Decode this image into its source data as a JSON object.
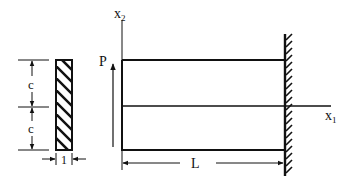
{
  "diagram": {
    "type": "cantilever-beam",
    "labels": {
      "axis_vertical": "x",
      "axis_vertical_sub": "2",
      "axis_horizontal": "x",
      "axis_horizontal_sub": "1",
      "load": "P",
      "length": "L",
      "half_depth_top": "c",
      "half_depth_bottom": "c",
      "thickness": "1"
    },
    "colors": {
      "stroke": "#111111",
      "background": "#ffffff"
    }
  }
}
